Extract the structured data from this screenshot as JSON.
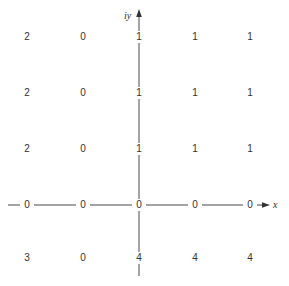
{
  "diagram": {
    "axes": {
      "x_label": "x",
      "y_label": "iy"
    },
    "grid": {
      "columns_x": [
        27,
        83,
        139,
        195,
        250
      ],
      "rows_y": [
        37,
        93,
        149,
        205,
        258
      ],
      "rows": [
        {
          "values": [
            "2",
            "0",
            "1",
            "1",
            "1"
          ]
        },
        {
          "values": [
            "2",
            "0",
            "1",
            "1",
            "1"
          ]
        },
        {
          "values": [
            "2",
            "0",
            "1",
            "1",
            "1"
          ]
        },
        {
          "values": [
            "0",
            "0",
            "0",
            "0",
            "0"
          ]
        },
        {
          "values": [
            "3",
            "0",
            "4",
            "4",
            "4"
          ]
        }
      ]
    },
    "colors": {
      "ink": "#333333",
      "background": "#ffffff"
    }
  }
}
